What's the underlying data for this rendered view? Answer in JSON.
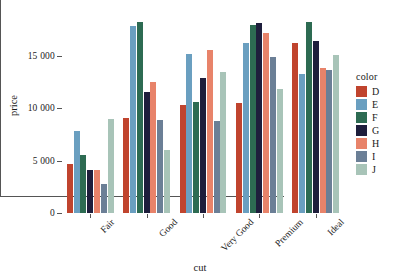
{
  "chart_data": {
    "type": "bar",
    "title": "",
    "subtitle": "",
    "xlabel": "cut",
    "ylabel": "price",
    "categories": [
      "Fair",
      "Good",
      "Very Good",
      "Premium",
      "Ideal"
    ],
    "ylim": [
      0,
      18600
    ],
    "yticks": [
      0,
      5000,
      10000,
      15000
    ],
    "ytick_labels": [
      "0",
      "5 000",
      "10 000",
      "15 000"
    ],
    "grid": false,
    "legend_position": "right",
    "legend_title": "color",
    "series": [
      {
        "name": "D",
        "color": "#c0442e",
        "values": [
          4700,
          9100,
          10300,
          10450,
          16250
        ]
      },
      {
        "name": "E",
        "color": "#6a9fc0",
        "values": [
          7800,
          17800,
          15150,
          16250,
          13300
        ]
      },
      {
        "name": "F",
        "color": "#2d6b52",
        "values": [
          5500,
          18200,
          10600,
          17900,
          18200
        ]
      },
      {
        "name": "G",
        "color": "#1e1e3c",
        "values": [
          4100,
          11500,
          12900,
          18100,
          16400
        ]
      },
      {
        "name": "H",
        "color": "#e8836a",
        "values": [
          4100,
          12450,
          15550,
          17200,
          13800
        ]
      },
      {
        "name": "I",
        "color": "#6b7f96",
        "values": [
          2800,
          8850,
          8750,
          14900,
          13650
        ]
      },
      {
        "name": "J",
        "color": "#a8c4b8",
        "values": [
          9000,
          6000,
          13450,
          11800,
          15050
        ]
      }
    ]
  },
  "legend": {
    "title": "color",
    "entries": [
      {
        "label": "D",
        "color": "#c0442e"
      },
      {
        "label": "E",
        "color": "#6a9fc0"
      },
      {
        "label": "F",
        "color": "#2d6b52"
      },
      {
        "label": "G",
        "color": "#1e1e3c"
      },
      {
        "label": "H",
        "color": "#e8836a"
      },
      {
        "label": "I",
        "color": "#6b7f96"
      },
      {
        "label": "J",
        "color": "#a8c4b8"
      }
    ]
  },
  "axes": {
    "x_title": "cut",
    "y_title": "price"
  }
}
